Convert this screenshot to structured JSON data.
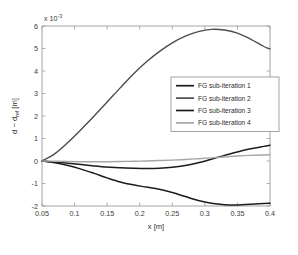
{
  "chart_data": {
    "type": "line",
    "title": "",
    "xlabel": "x [m]",
    "ylabel": "d − d_ref [m]",
    "ylabel_main": "d − d",
    "ylabel_sub": "ref",
    "ylabel_unit": " [m]",
    "y_exponent_label": "x 10",
    "y_exponent_power": "-3",
    "y_scale": 0.001,
    "xlim": [
      0.05,
      0.4
    ],
    "ylim": [
      -2,
      6
    ],
    "grid": false,
    "legend_position": "center-right",
    "xticks": [
      0.05,
      0.1,
      0.15,
      0.2,
      0.25,
      0.3,
      0.35,
      0.4
    ],
    "xticklabels": [
      "0.05",
      "0.1",
      "0.15",
      "0.2",
      "0.25",
      "0.3",
      "0.35",
      "0.4"
    ],
    "yticks": [
      -2,
      -1,
      0,
      1,
      2,
      3,
      4,
      5,
      6
    ],
    "yticklabels": [
      "-2",
      "-1",
      "0",
      "1",
      "2",
      "3",
      "4",
      "5",
      "6"
    ],
    "x": [
      0.05,
      0.07,
      0.09,
      0.11,
      0.13,
      0.15,
      0.17,
      0.19,
      0.21,
      0.23,
      0.25,
      0.27,
      0.29,
      0.31,
      0.33,
      0.35,
      0.37,
      0.39,
      0.4
    ],
    "series": [
      {
        "name": "FG sub-iteration 1",
        "color": "#1c1c1c",
        "width": 1.5,
        "values": [
          0.0,
          -0.08,
          -0.2,
          -0.36,
          -0.55,
          -0.75,
          -0.93,
          -1.06,
          -1.16,
          -1.26,
          -1.4,
          -1.58,
          -1.76,
          -1.88,
          -1.94,
          -1.95,
          -1.92,
          -1.89,
          -1.88
        ]
      },
      {
        "name": "FG sub-iteration 2",
        "color": "#4d4d4d",
        "width": 1.4,
        "values": [
          0.0,
          0.33,
          0.83,
          1.4,
          2.0,
          2.62,
          3.25,
          3.86,
          4.4,
          4.86,
          5.25,
          5.55,
          5.75,
          5.85,
          5.82,
          5.68,
          5.42,
          5.1,
          4.98
        ]
      },
      {
        "name": "FG sub-iteration 3",
        "color": "#1c1c1c",
        "width": 1.5,
        "values": [
          0.0,
          -0.04,
          -0.1,
          -0.16,
          -0.22,
          -0.27,
          -0.3,
          -0.32,
          -0.33,
          -0.32,
          -0.28,
          -0.2,
          -0.08,
          0.08,
          0.25,
          0.4,
          0.54,
          0.65,
          0.7
        ]
      },
      {
        "name": "FG sub-iteration 4",
        "color": "#a6a6a6",
        "width": 1.4,
        "values": [
          0.0,
          -0.01,
          -0.02,
          -0.03,
          -0.03,
          -0.03,
          -0.02,
          -0.01,
          0.0,
          0.02,
          0.04,
          0.07,
          0.1,
          0.14,
          0.18,
          0.22,
          0.25,
          0.27,
          0.28
        ]
      }
    ]
  },
  "legend": {
    "items": [
      {
        "label": "FG sub-iteration 1",
        "color": "#1c1c1c"
      },
      {
        "label": "FG sub-iteration 2",
        "color": "#4d4d4d"
      },
      {
        "label": "FG sub-iteration 3",
        "color": "#1c1c1c"
      },
      {
        "label": "FG sub-iteration 4",
        "color": "#a6a6a6"
      }
    ]
  }
}
